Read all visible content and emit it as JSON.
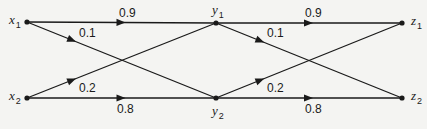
{
  "diagram": {
    "type": "two-stage transition graph",
    "colors": {
      "line": "#1a1a1a",
      "background": "#f4f4f2"
    },
    "nodes": [
      {
        "id": "x1",
        "letter": "x",
        "sub": "1",
        "x": 27,
        "y": 22,
        "label_pos": "left"
      },
      {
        "id": "x2",
        "letter": "x",
        "sub": "2",
        "x": 27,
        "y": 98,
        "label_pos": "left"
      },
      {
        "id": "y1",
        "letter": "y",
        "sub": "1",
        "x": 216,
        "y": 23,
        "label_pos": "top"
      },
      {
        "id": "y2",
        "letter": "y",
        "sub": "2",
        "x": 216,
        "y": 98,
        "label_pos": "bottom"
      },
      {
        "id": "z1",
        "letter": "z",
        "sub": "1",
        "x": 402,
        "y": 23,
        "label_pos": "right"
      },
      {
        "id": "z2",
        "letter": "z",
        "sub": "2",
        "x": 402,
        "y": 98,
        "label_pos": "right"
      }
    ],
    "edges": [
      {
        "from": "x1",
        "to": "y1",
        "weight": "0.9",
        "arrow_t": 0.5,
        "label_x": 119,
        "label_y": 17
      },
      {
        "from": "x1",
        "to": "y2",
        "weight": "0.1",
        "arrow_t": 0.24,
        "label_x": 79,
        "label_y": 37
      },
      {
        "from": "x2",
        "to": "y1",
        "weight": "0.2",
        "arrow_t": 0.24,
        "label_x": 79,
        "label_y": 92
      },
      {
        "from": "x2",
        "to": "y2",
        "weight": "0.8",
        "arrow_t": 0.5,
        "label_x": 117,
        "label_y": 113
      },
      {
        "from": "y1",
        "to": "z1",
        "weight": "0.9",
        "arrow_t": 0.5,
        "label_x": 305,
        "label_y": 17
      },
      {
        "from": "y1",
        "to": "z2",
        "weight": "0.1",
        "arrow_t": 0.24,
        "label_x": 267,
        "label_y": 37
      },
      {
        "from": "y2",
        "to": "z1",
        "weight": "0.2",
        "arrow_t": 0.24,
        "label_x": 267,
        "label_y": 92
      },
      {
        "from": "y2",
        "to": "z2",
        "weight": "0.8",
        "arrow_t": 0.5,
        "label_x": 305,
        "label_y": 113
      }
    ]
  }
}
